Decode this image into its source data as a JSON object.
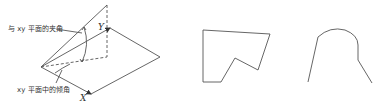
{
  "figure": {
    "left_panel": {
      "label_angle_with_plane": "与 xy 平面的夹角",
      "label_inclination_in_plane": "xy 平面中的倾角",
      "axis_x": "X",
      "axis_y": "Y"
    },
    "middle_panel": {
      "shape": "polygon",
      "points": [
        [
          203,
          30
        ],
        [
          270,
          34
        ],
        [
          258,
          70
        ],
        [
          235,
          58
        ],
        [
          221,
          82
        ],
        [
          203,
          82
        ]
      ]
    },
    "right_panel": {
      "shape": "open-curve"
    },
    "colors": {
      "stroke": "#555555",
      "background": "#ffffff"
    }
  }
}
